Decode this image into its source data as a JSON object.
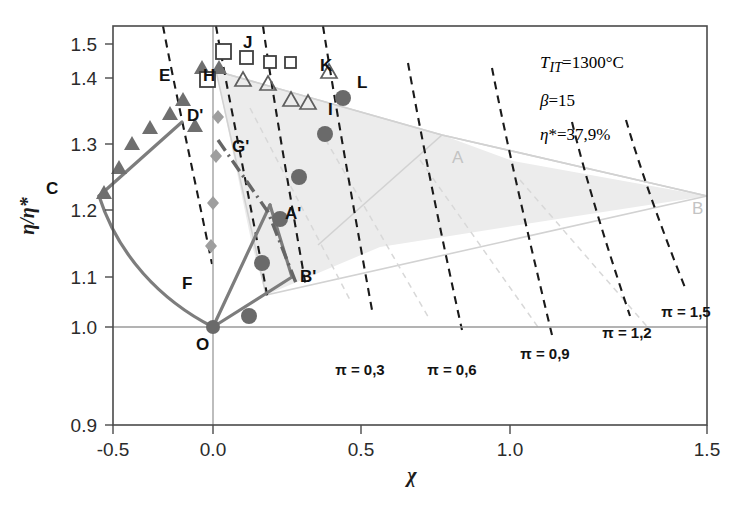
{
  "chart_data": {
    "type": "scatter",
    "title": "",
    "xlabel": "χ",
    "ylabel": "η/η*",
    "xlim": [
      -0.5,
      1.5
    ],
    "ylim": [
      0.9,
      1.5
    ],
    "xticks": [
      "-0.5",
      "0.0",
      "0.5",
      "1.0",
      "1.5"
    ],
    "xtick_values": [
      -0.5,
      0.0,
      0.5,
      1.0,
      1.5
    ],
    "yticks": [
      "0.9",
      "1.0",
      "1.1",
      "1.2",
      "1.3",
      "1.4",
      "1.5"
    ],
    "ytick_values": [
      0.9,
      1.0,
      1.1,
      1.2,
      1.3,
      1.4,
      1.5
    ],
    "grid": false,
    "legend": "none",
    "annotations": [
      {
        "name": "turbine-inlet-temperature",
        "html": "<i>T<sub>IT</sub></i>=1300°C",
        "x": 0.86,
        "y": 1.455
      },
      {
        "name": "pressure-ratio",
        "html": "<i>β</i>=15",
        "x": 0.86,
        "y": 1.395
      },
      {
        "name": "reference-efficiency",
        "html": "<i>η</i>*=37,9%",
        "x": 0.86,
        "y": 1.335
      }
    ],
    "contours": [
      {
        "label": "π = 0,3",
        "value": 0.3,
        "label_x": 0.3,
        "label_y": 0.962
      },
      {
        "label": "π = 0,6",
        "value": 0.6,
        "label_x": 0.545,
        "label_y": 0.962
      },
      {
        "label": "π = 0,9",
        "value": 0.9,
        "label_x": 0.8,
        "label_y": 0.985
      },
      {
        "label": "π = 1,2",
        "value": 1.2,
        "label_x": 1.055,
        "label_y": 1.017
      },
      {
        "label": "π = 1,5",
        "value": 1.5,
        "label_x": 1.285,
        "label_y": 1.048
      }
    ],
    "point_labels": [
      {
        "name": "label-C",
        "text": "C",
        "x": -0.315,
        "y": 1.288,
        "style": "dark"
      },
      {
        "name": "label-D",
        "text": "D'",
        "x": -0.055,
        "y": 1.402,
        "style": "dark"
      },
      {
        "name": "label-E",
        "text": "E",
        "x": -0.145,
        "y": 1.462,
        "style": "dark"
      },
      {
        "name": "label-F",
        "text": "F",
        "x": -0.105,
        "y": 1.128,
        "style": "dark"
      },
      {
        "name": "label-G",
        "text": "G'",
        "x": 0.055,
        "y": 1.33,
        "style": "dark"
      },
      {
        "name": "label-H",
        "text": "H",
        "x": -0.025,
        "y": 1.462,
        "style": "dark"
      },
      {
        "name": "label-I",
        "text": "I",
        "x": 0.222,
        "y": 1.4,
        "style": "dark"
      },
      {
        "name": "label-J",
        "text": "J",
        "x": 0.012,
        "y": 1.508,
        "style": "dark"
      },
      {
        "name": "label-K",
        "text": "K",
        "x": 0.185,
        "y": 1.475,
        "style": "dark"
      },
      {
        "name": "label-L",
        "text": "L",
        "x": 0.263,
        "y": 1.44,
        "style": "dark"
      },
      {
        "name": "label-A-prime",
        "text": "A'",
        "x": 0.155,
        "y": 1.17,
        "style": "dark"
      },
      {
        "name": "label-B-prime",
        "text": "B'",
        "x": 0.205,
        "y": 1.108,
        "style": "dark"
      },
      {
        "name": "label-O",
        "text": "O",
        "x": -0.035,
        "y": 0.978,
        "style": "dark"
      },
      {
        "name": "label-A",
        "text": "A",
        "x": 0.492,
        "y": 1.318,
        "style": "gray"
      },
      {
        "name": "label-B",
        "text": "B",
        "x": 1.345,
        "y": 1.192,
        "style": "gray"
      }
    ],
    "series": [
      {
        "name": "filled-triangles",
        "marker": "triangle-filled",
        "points": [
          [
            -0.255,
            1.318
          ],
          [
            -0.205,
            1.355
          ],
          [
            -0.165,
            1.392
          ],
          [
            -0.128,
            1.415
          ],
          [
            -0.082,
            1.437
          ],
          [
            -0.048,
            1.45
          ],
          [
            -0.012,
            1.452
          ],
          [
            -0.062,
            1.408
          ]
        ]
      },
      {
        "name": "open-triangles",
        "marker": "triangle-open",
        "points": [
          [
            0.03,
            1.448
          ],
          [
            0.082,
            1.442
          ],
          [
            0.118,
            1.418
          ],
          [
            0.175,
            1.408
          ],
          [
            0.232,
            1.437
          ]
        ]
      },
      {
        "name": "open-squares",
        "marker": "square-open",
        "points": [
          [
            -0.042,
            1.432
          ],
          [
            0.008,
            1.488
          ],
          [
            0.055,
            1.475
          ],
          [
            0.105,
            1.468
          ],
          [
            0.145,
            1.468
          ]
        ]
      },
      {
        "name": "filled-circles",
        "marker": "circle-filled",
        "points": [
          [
            0.258,
            1.412
          ],
          [
            0.215,
            1.355
          ],
          [
            0.152,
            1.292
          ],
          [
            0.108,
            1.228
          ],
          [
            0.062,
            1.162
          ],
          [
            0.035,
            1.082
          ]
        ]
      },
      {
        "name": "gray-diamonds",
        "marker": "diamond-filled",
        "points": [
          [
            0.012,
            1.388
          ],
          [
            0.008,
            1.33
          ],
          [
            0.002,
            1.258
          ],
          [
            -0.002,
            1.192
          ]
        ]
      }
    ],
    "polylines": [
      {
        "name": "path-C-D-prime",
        "points": [
          [
            -0.268,
            1.288
          ],
          [
            -0.052,
            1.398
          ]
        ]
      },
      {
        "name": "path-C-F-O",
        "points": [
          [
            -0.268,
            1.288
          ],
          [
            -0.135,
            1.118
          ],
          [
            0.0,
            1.0
          ]
        ]
      },
      {
        "name": "path-O-A-prime",
        "points": [
          [
            0.0,
            1.0
          ],
          [
            0.142,
            1.183
          ]
        ]
      },
      {
        "name": "path-O-B-prime",
        "points": [
          [
            0.0,
            1.0
          ],
          [
            0.198,
            1.075
          ]
        ]
      },
      {
        "name": "path-A-prime-B-prime",
        "points": [
          [
            0.142,
            1.183
          ],
          [
            0.198,
            1.075
          ]
        ]
      },
      {
        "name": "path-G-prime-A-prime-dashdot",
        "points": [
          [
            0.012,
            1.352
          ],
          [
            0.142,
            1.178
          ],
          [
            0.205,
            1.072
          ]
        ]
      }
    ],
    "shaded_region": {
      "name": "feasible-region",
      "vertices": [
        [
          0.012,
          1.432
        ],
        [
          0.468,
          1.302
        ],
        [
          1.325,
          1.192
        ],
        [
          0.215,
          1.06
        ]
      ]
    }
  }
}
